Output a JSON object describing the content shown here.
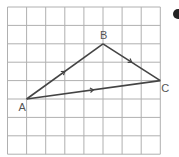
{
  "diagram": {
    "type": "grid-vector-triangle",
    "grid": {
      "columns": 8,
      "rows": 8,
      "origin_x": 7.5,
      "origin_y": 7,
      "cell_w": 19.1,
      "cell_h": 18.4,
      "line_color": "#b0b0b0"
    },
    "points": [
      {
        "label": "A",
        "col": 1,
        "row": 5
      },
      {
        "label": "B",
        "col": 5,
        "row": 2
      },
      {
        "label": "C",
        "col": 8,
        "row": 4
      }
    ],
    "vectors": [
      {
        "from": "A",
        "to": "B",
        "arrow": true
      },
      {
        "from": "B",
        "to": "C",
        "arrow": true
      },
      {
        "from": "A",
        "to": "C",
        "arrow": true
      }
    ],
    "line_color": "#444444",
    "label_color": "#555555",
    "bullet_color": "#222222"
  }
}
